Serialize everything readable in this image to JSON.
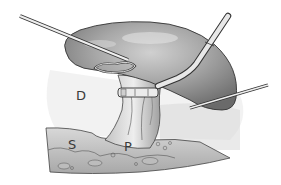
{
  "figure": {
    "type": "medical-illustration",
    "style": "grayscale",
    "labels": {
      "D": "D",
      "S": "S",
      "P": "P"
    },
    "elements": [
      "organ",
      "instrument-left",
      "instrument-right-scope",
      "instrument-right-small",
      "clip-applicator",
      "vascular-pedicle",
      "tissue-base"
    ]
  },
  "colors": {
    "background": "#ffffff",
    "organ_fill": "#9a9a9a",
    "organ_shadow": "#6e6e6e",
    "organ_highlight": "#d4d4d4",
    "tissue": "#c8c8c8",
    "outline": "#333333",
    "instrument": "#e6e6e6"
  }
}
